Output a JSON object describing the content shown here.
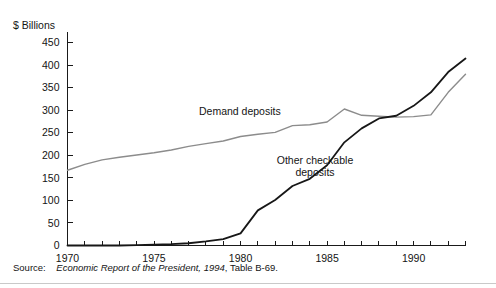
{
  "figure": {
    "background_color": "#ffffff",
    "source_prefix": "Source:",
    "source_italic": "Economic Report of the President, 1994",
    "source_suffix": ", Table B-69."
  },
  "chart_data": {
    "type": "line",
    "title": "",
    "subtitle": "",
    "xlabel": "",
    "ylabel": "$ Billions",
    "ylim": [
      0,
      475
    ],
    "xlim": [
      1970,
      1993
    ],
    "grid": false,
    "legend_position": "inline-annotation",
    "y_ticks": [
      0,
      50,
      100,
      150,
      200,
      250,
      300,
      350,
      400,
      450
    ],
    "y_tick_labels": [
      "0",
      "50",
      "100",
      "150",
      "200",
      "250",
      "300",
      "350",
      "400",
      "450"
    ],
    "x_ticks": [
      1970,
      1971,
      1972,
      1973,
      1974,
      1975,
      1976,
      1977,
      1978,
      1979,
      1980,
      1981,
      1982,
      1983,
      1984,
      1985,
      1986,
      1987,
      1988,
      1989,
      1990,
      1991,
      1992,
      1993
    ],
    "x_tick_labels_shown": [
      "1970",
      "1975",
      "1980",
      "1985",
      "1990"
    ],
    "x_labeled_ticks": [
      1970,
      1975,
      1980,
      1985,
      1990
    ],
    "x": [
      1970,
      1971,
      1972,
      1973,
      1974,
      1975,
      1976,
      1977,
      1978,
      1979,
      1980,
      1981,
      1982,
      1983,
      1984,
      1985,
      1986,
      1987,
      1988,
      1989,
      1990,
      1991,
      1992,
      1993
    ],
    "series": [
      {
        "name": "Demand deposits",
        "color": "#8c8c8c",
        "width": 1.4,
        "annotation": "Demand deposits",
        "annotation_x": 1977.6,
        "annotation_y": 290,
        "values": [
          167,
          180,
          190,
          196,
          201,
          206,
          212,
          220,
          226,
          232,
          242,
          247,
          251,
          266,
          268,
          274,
          303,
          289,
          287,
          285,
          286,
          290,
          340,
          380
        ]
      },
      {
        "name": "Other checkable deposits",
        "color": "#171717",
        "width": 1.8,
        "annotation_line1": "Other checkable",
        "annotation_line2": "deposits",
        "annotation_x": 1984.3,
        "annotation_y": 182,
        "values": [
          0,
          0,
          0,
          0,
          1,
          2,
          3,
          5,
          9,
          14,
          27,
          78,
          101,
          132,
          148,
          178,
          229,
          260,
          282,
          288,
          310,
          340,
          385,
          415
        ]
      }
    ]
  }
}
